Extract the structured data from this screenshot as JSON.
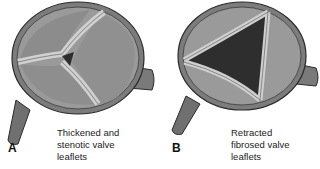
{
  "figure": {
    "panels": [
      {
        "letter": "A",
        "caption_lines": [
          "Thickened and",
          "stenotic valve",
          "leaflets"
        ],
        "condition": "stenosis"
      },
      {
        "letter": "B",
        "caption_lines": [
          "Retracted",
          "fibrosed valve",
          "leaflets"
        ],
        "condition": "regurgitation"
      }
    ],
    "colors": {
      "background": "#ffffff",
      "wall": "#8a8a8a",
      "wall_dark": "#5a5a5a",
      "cusp": "#9a9a9a",
      "leaflet": "#cfcfcf",
      "opening": "#2e2e2e",
      "outline": "#2a2a2a"
    }
  }
}
